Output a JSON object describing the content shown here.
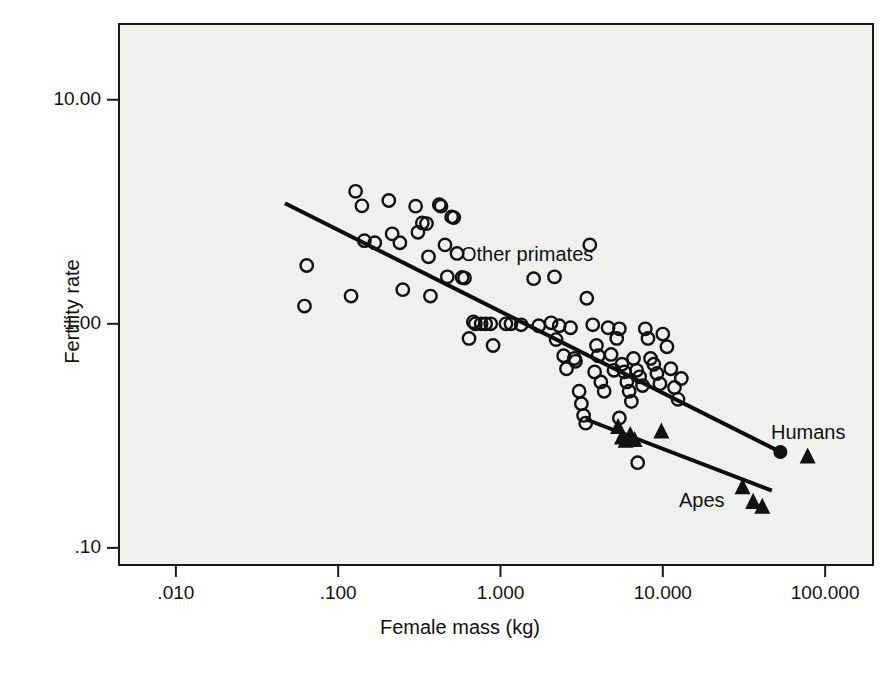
{
  "chart_data": {
    "type": "scatter",
    "title": "",
    "xlabel": "Female mass (kg)",
    "ylabel": "Fertility rate",
    "xscale": "log",
    "yscale": "log",
    "xlim": [
      0.0044,
      200.0
    ],
    "ylim": [
      0.083,
      22.0
    ],
    "grid": false,
    "legend_position": "inline-annotations",
    "xticks": [
      {
        "value": 0.01,
        "label": ".010"
      },
      {
        "value": 0.1,
        "label": ".100"
      },
      {
        "value": 1.0,
        "label": "1.000"
      },
      {
        "value": 10.0,
        "label": "10.000"
      },
      {
        "value": 100.0,
        "label": "100.000"
      }
    ],
    "yticks": [
      {
        "value": 10.0,
        "label": "10.00"
      },
      {
        "value": 1.0,
        "label": "1.00"
      },
      {
        "value": 0.1,
        "label": ".10"
      }
    ],
    "annotations": [
      {
        "text": "Other primates",
        "x": 0.62,
        "y": 1.6
      },
      {
        "text": "Humans",
        "x": 31.0,
        "y": 0.355
      },
      {
        "text": "Apes",
        "x": 6.1,
        "y": 0.212
      }
    ],
    "series": [
      {
        "name": "Other primates",
        "marker": "open-circle",
        "color": "#111111",
        "points": [
          [
            0.064,
            1.82
          ],
          [
            0.062,
            1.2
          ],
          [
            0.12,
            1.33
          ],
          [
            0.128,
            3.9
          ],
          [
            0.14,
            3.36
          ],
          [
            0.145,
            2.35
          ],
          [
            0.168,
            2.3
          ],
          [
            0.205,
            3.55
          ],
          [
            0.215,
            2.52
          ],
          [
            0.24,
            2.3
          ],
          [
            0.25,
            1.42
          ],
          [
            0.3,
            3.35
          ],
          [
            0.31,
            2.56
          ],
          [
            0.33,
            2.82
          ],
          [
            0.35,
            2.8
          ],
          [
            0.36,
            1.99
          ],
          [
            0.37,
            1.33
          ],
          [
            0.42,
            3.4
          ],
          [
            0.43,
            3.35
          ],
          [
            0.455,
            2.25
          ],
          [
            0.47,
            1.62
          ],
          [
            0.5,
            3.0
          ],
          [
            0.515,
            2.98
          ],
          [
            0.54,
            2.06
          ],
          [
            0.58,
            1.61
          ],
          [
            0.6,
            1.6
          ],
          [
            0.64,
            0.86
          ],
          [
            0.68,
            1.02
          ],
          [
            0.7,
            1.0
          ],
          [
            0.76,
            1.0
          ],
          [
            0.81,
            1.0
          ],
          [
            0.87,
            1.0
          ],
          [
            0.9,
            0.8
          ],
          [
            1.08,
            1.0
          ],
          [
            1.16,
            1.0
          ],
          [
            1.34,
            0.99
          ],
          [
            1.6,
            1.59
          ],
          [
            1.72,
            0.98
          ],
          [
            2.05,
            1.01
          ],
          [
            2.15,
            1.62
          ],
          [
            2.3,
            0.98
          ],
          [
            2.45,
            0.72
          ],
          [
            2.55,
            0.63
          ],
          [
            2.7,
            0.96
          ],
          [
            2.85,
            0.7
          ],
          [
            2.9,
            0.68
          ],
          [
            3.05,
            0.5
          ],
          [
            3.15,
            0.44
          ],
          [
            3.25,
            0.39
          ],
          [
            3.35,
            0.36
          ],
          [
            3.4,
            1.3
          ],
          [
            3.55,
            2.25
          ],
          [
            3.7,
            0.99
          ],
          [
            3.8,
            0.61
          ],
          [
            3.9,
            0.8
          ],
          [
            4.0,
            0.72
          ],
          [
            4.15,
            0.55
          ],
          [
            4.35,
            0.5
          ],
          [
            4.6,
            0.96
          ],
          [
            4.8,
            0.73
          ],
          [
            5.0,
            0.62
          ],
          [
            5.2,
            0.86
          ],
          [
            5.4,
            0.95
          ],
          [
            5.6,
            0.66
          ],
          [
            5.8,
            0.61
          ],
          [
            6.0,
            0.55
          ],
          [
            6.2,
            0.5
          ],
          [
            6.4,
            0.45
          ],
          [
            6.6,
            0.7
          ],
          [
            6.9,
            0.62
          ],
          [
            7.2,
            0.58
          ],
          [
            7.5,
            0.53
          ],
          [
            7.8,
            0.95
          ],
          [
            8.1,
            0.86
          ],
          [
            8.4,
            0.7
          ],
          [
            8.8,
            0.66
          ],
          [
            9.2,
            0.6
          ],
          [
            9.6,
            0.54
          ],
          [
            10.0,
            0.9
          ],
          [
            10.6,
            0.79
          ],
          [
            11.2,
            0.63
          ],
          [
            11.8,
            0.52
          ],
          [
            12.4,
            0.46
          ],
          [
            13.0,
            0.57
          ],
          [
            7.0,
            0.24
          ],
          [
            5.4,
            0.38
          ],
          [
            2.2,
            0.85
          ]
        ]
      },
      {
        "name": "Apes",
        "marker": "filled-triangle",
        "color": "#111111",
        "points": [
          [
            5.3,
            0.345
          ],
          [
            5.6,
            0.31
          ],
          [
            5.9,
            0.3
          ],
          [
            6.3,
            0.318
          ],
          [
            6.7,
            0.302
          ],
          [
            9.8,
            0.33
          ],
          [
            31.0,
            0.186
          ],
          [
            36.0,
            0.16
          ],
          [
            41.0,
            0.152
          ],
          [
            78.0,
            0.255
          ]
        ]
      },
      {
        "name": "Humans",
        "marker": "filled-circle",
        "color": "#111111",
        "points": [
          [
            53.0,
            0.268
          ]
        ]
      }
    ],
    "trendlines": [
      {
        "name": "Other primates regression",
        "x0": 0.047,
        "y0": 3.45,
        "x1": 53.0,
        "y1": 0.268
      },
      {
        "name": "Apes regression",
        "x0": 3.35,
        "y0": 0.375,
        "x1": 47.0,
        "y1": 0.18
      }
    ]
  },
  "axes": {
    "y_title": "Fertility rate",
    "x_title": "Female mass (kg)"
  }
}
